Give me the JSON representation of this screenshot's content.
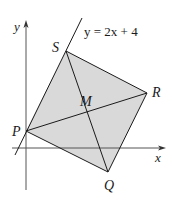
{
  "diagram": {
    "type": "coordinate-geometry-square",
    "fill_color": "#d9d9d9",
    "line_color": "#1a1a1a",
    "axis_color": "#555555",
    "axes": {
      "x_label": "x",
      "y_label": "y"
    },
    "line_label": "y = 2x + 4",
    "points": [
      {
        "name": "P",
        "label": "P"
      },
      {
        "name": "Q",
        "label": "Q"
      },
      {
        "name": "R",
        "label": "R"
      },
      {
        "name": "S",
        "label": "S"
      },
      {
        "name": "M",
        "label": "M"
      }
    ],
    "polygon": [
      "P",
      "Q",
      "R",
      "S"
    ],
    "diagonals": [
      [
        "P",
        "R"
      ],
      [
        "S",
        "Q"
      ]
    ]
  }
}
